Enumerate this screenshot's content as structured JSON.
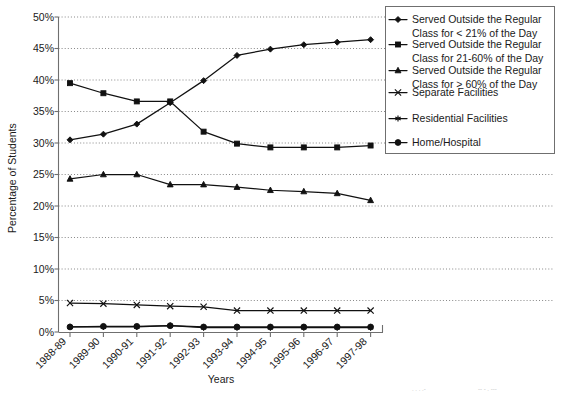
{
  "chart_data": {
    "type": "line",
    "title": "",
    "xlabel": "Years",
    "ylabel": "Percentage of Students",
    "categories": [
      "1988-89",
      "1989-90",
      "1990-91",
      "1991-92",
      "1992-93",
      "1993-94",
      "1994-95",
      "1995-96",
      "1996-97",
      "1997-98"
    ],
    "ylim": [
      0,
      50
    ],
    "ytick_labels": [
      "0%",
      "5%",
      "10%",
      "15%",
      "20%",
      "25%",
      "30%",
      "35%",
      "40%",
      "45%",
      "50%"
    ],
    "ytick_values": [
      0,
      5,
      10,
      15,
      20,
      25,
      30,
      35,
      40,
      45,
      50
    ],
    "grid": true,
    "legend_position": "right-top",
    "series": [
      {
        "name": "Served Outside the Regular Class for < 21% of the Day",
        "marker": "diamond",
        "values": [
          30.5,
          31.4,
          33.0,
          36.4,
          39.9,
          43.9,
          44.9,
          45.6,
          46.0,
          46.4
        ]
      },
      {
        "name": "Served Outside the Regular Class for 21-60% of the Day",
        "marker": "square",
        "values": [
          39.5,
          37.9,
          36.6,
          36.6,
          31.8,
          29.9,
          29.3,
          29.3,
          29.3,
          29.6
        ]
      },
      {
        "name": "Served Outside the Regular Class for > 60% of the Day",
        "marker": "triangle",
        "values": [
          24.3,
          25.0,
          25.0,
          23.4,
          23.4,
          23.0,
          22.5,
          22.3,
          22.0,
          20.9
        ]
      },
      {
        "name": "Separate Facilities",
        "marker": "cross",
        "values": [
          4.6,
          4.5,
          4.3,
          4.1,
          4.0,
          3.4,
          3.4,
          3.4,
          3.4,
          3.4
        ]
      },
      {
        "name": "Residential Facilities",
        "marker": "asterisk",
        "values": [
          0.8,
          0.8,
          0.8,
          1.0,
          0.7,
          0.7,
          0.7,
          0.7,
          0.7,
          0.7
        ]
      },
      {
        "name": "Home/Hospital",
        "marker": "circle",
        "values": [
          0.8,
          0.9,
          0.9,
          1.0,
          0.8,
          0.8,
          0.8,
          0.8,
          0.8,
          0.8
        ]
      }
    ]
  },
  "axes": {
    "ylabel": "Percentage of Students",
    "xlabel": "Years"
  },
  "legend": {
    "entries": [
      {
        "label_line1": "Served Outside the Regular",
        "label_line2": "Class for < 21% of the Day",
        "marker": "diamond"
      },
      {
        "label_line1": "Served Outside the Regular",
        "label_line2": "Class for 21-60% of the Day",
        "marker": "square"
      },
      {
        "label_line1": "Served Outside the Regular",
        "label_line2": "Class for > 60% of the Day",
        "marker": "triangle"
      },
      {
        "label_line1": "Separate Facilities",
        "label_line2": "",
        "marker": "cross"
      },
      {
        "label_line1": "Residential Facilities",
        "label_line2": "",
        "marker": "asterisk"
      },
      {
        "label_line1": "Home/Hospital",
        "label_line2": "",
        "marker": "circle"
      }
    ]
  },
  "ticks": {
    "y": [
      "50%",
      "45%",
      "40%",
      "35%",
      "30%",
      "25%",
      "20%",
      "15%",
      "10%",
      "5%",
      "0%"
    ],
    "x": [
      "1988-89",
      "1989-90",
      "1990-91",
      "1991-92",
      "1992-93",
      "1993-94",
      "1994-95",
      "1995-96",
      "1996-97",
      "1997-98"
    ]
  },
  "colors": {
    "ink": "#111111",
    "axis": "#6f6f6f",
    "grid": "#7a7a7a",
    "background": "#ffffff"
  }
}
